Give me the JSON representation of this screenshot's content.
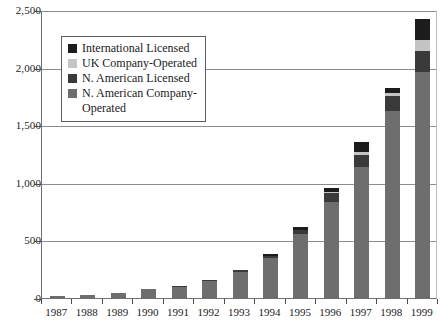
{
  "chart_data": {
    "type": "bar",
    "stacked": true,
    "title": "",
    "subtitle": "",
    "xlabel": "",
    "ylabel": "",
    "ylim": [
      0,
      2500
    ],
    "yticks": [
      0,
      500,
      1000,
      1500,
      2000,
      2500
    ],
    "ytick_labels": [
      "0",
      "500",
      "1,000",
      "1,500",
      "2,000",
      "2,500"
    ],
    "grid": true,
    "legend_position": "upper-left-inside",
    "categories": [
      "1987",
      "1988",
      "1989",
      "1990",
      "1991",
      "1992",
      "1993",
      "1994",
      "1995",
      "1996",
      "1997",
      "1998",
      "1999"
    ],
    "series": [
      {
        "name": "N. American Company-Operated",
        "color": "#6e6e6e",
        "values": [
          17,
          26,
          46,
          75,
          95,
          150,
          226,
          346,
          553,
          836,
          1135,
          1622,
          1965
        ]
      },
      {
        "name": "N. American Licensed",
        "color": "#3a3a3a",
        "values": [
          0,
          0,
          0,
          0,
          5,
          5,
          13,
          20,
          40,
          75,
          110,
          133,
          179
        ]
      },
      {
        "name": "UK Company-Operated",
        "color": "#c4c4c4",
        "values": [
          0,
          0,
          0,
          0,
          0,
          0,
          0,
          0,
          0,
          10,
          25,
          21,
          97
        ]
      },
      {
        "name": "International Licensed",
        "color": "#1c1c1c",
        "values": [
          0,
          0,
          0,
          0,
          0,
          0,
          0,
          20,
          25,
          30,
          85,
          45,
          184
        ]
      }
    ],
    "totals": [
      17,
      26,
      46,
      75,
      100,
      155,
      239,
      386,
      618,
      951,
      1355,
      1821,
      2425
    ]
  },
  "legend": {
    "entries": [
      {
        "label": "International Licensed",
        "color": "#1c1c1c",
        "swatch_name": "legend-swatch-international-licensed"
      },
      {
        "label": "UK Company-Operated",
        "color": "#c4c4c4",
        "swatch_name": "legend-swatch-uk-company-operated"
      },
      {
        "label": "N. American Licensed",
        "color": "#3a3a3a",
        "swatch_name": "legend-swatch-na-licensed"
      },
      {
        "label": "N. American Company-\nOperated",
        "color": "#6e6e6e",
        "swatch_name": "legend-swatch-na-company-operated"
      }
    ]
  },
  "colors": {
    "axis": "#4a4a4a",
    "gridline": "#8d8d8d",
    "background": "#ffffff",
    "text": "#1a1a1a"
  }
}
